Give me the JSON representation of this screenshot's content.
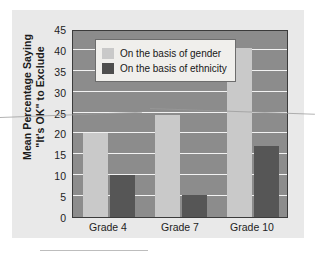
{
  "chart_data": {
    "type": "bar",
    "title": "",
    "subtitle": "",
    "xlabel": "",
    "ylabel": "Mean Percentage Saying \"It's OK\" to Exclude",
    "ylabel_lines": [
      "Mean Percentage Saying",
      "\"It's OK\" to Exclude"
    ],
    "categories": [
      "Grade 4",
      "Grade 7",
      "Grade 10"
    ],
    "series": [
      {
        "name": "On the basis of gender",
        "color": "#c9c9c9",
        "values": [
          20,
          24.5,
          40.5
        ]
      },
      {
        "name": "On the basis of ethnicity",
        "color": "#565656",
        "values": [
          10,
          5.2,
          17
        ]
      }
    ],
    "ylim": [
      0,
      45
    ],
    "yticks": [
      0,
      5,
      10,
      15,
      20,
      25,
      30,
      35,
      40,
      45
    ],
    "ytick_labels": [
      "0",
      "5",
      "10",
      "15",
      "20",
      "25",
      "30",
      "35",
      "40",
      "45"
    ],
    "grid": true,
    "grid_color": "#f2f2f2",
    "legend_position": "upper left",
    "plot_background": "#8c8c8c",
    "panel_background": "#e9e9e9"
  }
}
